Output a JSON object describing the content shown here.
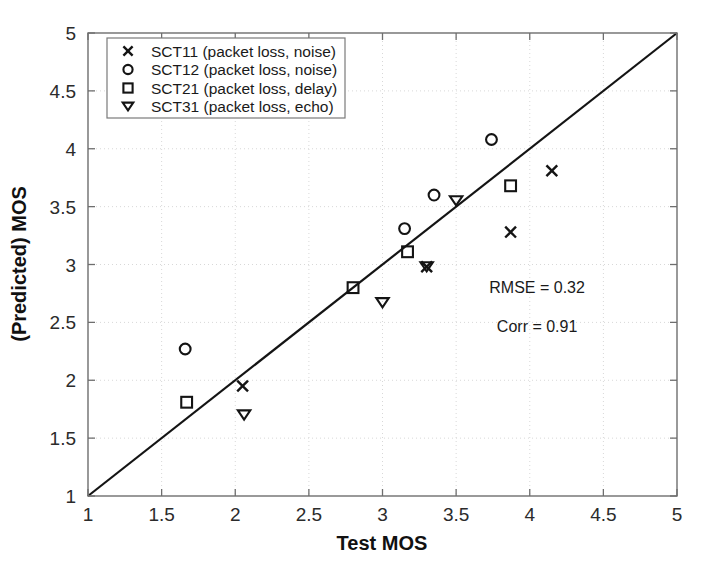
{
  "chart_data": {
    "type": "scatter",
    "title": "",
    "xlabel": "Test MOS",
    "ylabel": "(Predicted) MOS",
    "xlim": [
      1,
      5
    ],
    "ylim": [
      1,
      5
    ],
    "xticks": [
      "1",
      "1.5",
      "2",
      "2.5",
      "3",
      "3.5",
      "4",
      "4.5",
      "5"
    ],
    "yticks": [
      "1",
      "1.5",
      "2",
      "2.5",
      "3",
      "3.5",
      "4",
      "4.5",
      "5"
    ],
    "xtick_values": [
      1,
      1.5,
      2,
      2.5,
      3,
      3.5,
      4,
      4.5,
      5
    ],
    "ytick_values": [
      1,
      1.5,
      2,
      2.5,
      3,
      3.5,
      4,
      4.5,
      5
    ],
    "grid": true,
    "grid_style": "dotted",
    "legend_position": "upper left",
    "reference_line": {
      "name": "identity-line",
      "from": [
        1,
        1
      ],
      "to": [
        5,
        5
      ],
      "style": "solid",
      "color": "#141414"
    },
    "series": [
      {
        "name": "SCT11 (packet loss, noise)",
        "marker": "x",
        "points": [
          {
            "x": 2.05,
            "y": 1.95
          },
          {
            "x": 3.3,
            "y": 2.98
          },
          {
            "x": 3.87,
            "y": 3.28
          },
          {
            "x": 4.15,
            "y": 3.81
          }
        ]
      },
      {
        "name": "SCT12 (packet loss, noise)",
        "marker": "o",
        "points": [
          {
            "x": 1.66,
            "y": 2.27
          },
          {
            "x": 3.15,
            "y": 3.31
          },
          {
            "x": 3.35,
            "y": 3.6
          },
          {
            "x": 3.74,
            "y": 4.08
          }
        ]
      },
      {
        "name": "SCT21 (packet loss, delay)",
        "marker": "square",
        "points": [
          {
            "x": 1.67,
            "y": 1.81
          },
          {
            "x": 2.8,
            "y": 2.8
          },
          {
            "x": 3.17,
            "y": 3.11
          },
          {
            "x": 3.87,
            "y": 3.68
          }
        ]
      },
      {
        "name": "SCT31 (packet loss, echo)",
        "marker": "triangle-down",
        "points": [
          {
            "x": 2.06,
            "y": 1.7
          },
          {
            "x": 3.0,
            "y": 2.67
          },
          {
            "x": 3.3,
            "y": 2.98
          },
          {
            "x": 3.5,
            "y": 3.55
          }
        ]
      }
    ],
    "annotations": [
      {
        "name": "rmse-annotation",
        "text": "RMSE = 0.32",
        "x": 4.05,
        "y": 2.75
      },
      {
        "name": "corr-annotation",
        "text": "Corr = 0.91",
        "x": 4.05,
        "y": 2.42
      }
    ]
  },
  "legend": {
    "entries": [
      {
        "marker": "x",
        "label": "SCT11 (packet loss, noise)"
      },
      {
        "marker": "o",
        "label": "SCT12 (packet loss, noise)"
      },
      {
        "marker": "square",
        "label": "SCT21 (packet loss, delay)"
      },
      {
        "marker": "triangle-down",
        "label": "SCT31 (packet loss, echo)"
      }
    ]
  },
  "colors": {
    "marker": "#141414",
    "line": "#141414",
    "grid": "#d8d8d8",
    "axis": "#6e6e6e",
    "background": "#ffffff"
  }
}
